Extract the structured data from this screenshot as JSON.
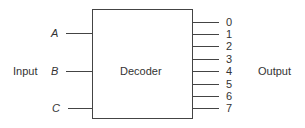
{
  "diagram": {
    "block_label": "Decoder",
    "input_group_label": "Input",
    "output_group_label": "Output",
    "inputs": [
      {
        "label": "A",
        "y": 33
      },
      {
        "label": "B",
        "y": 71
      },
      {
        "label": "C",
        "y": 108
      }
    ],
    "outputs": [
      {
        "label": "0",
        "y": 22
      },
      {
        "label": "1",
        "y": 34
      },
      {
        "label": "2",
        "y": 46
      },
      {
        "label": "3",
        "y": 59
      },
      {
        "label": "4",
        "y": 71
      },
      {
        "label": "5",
        "y": 84
      },
      {
        "label": "6",
        "y": 96
      },
      {
        "label": "7",
        "y": 108
      }
    ]
  }
}
